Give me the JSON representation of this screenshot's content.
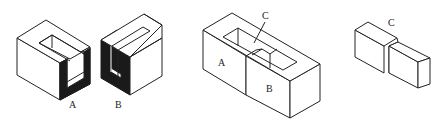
{
  "figures": [
    {
      "id": "block-a",
      "label": "A",
      "description": "Hollow block with U-shaped slot, dark inner walls visible on right"
    },
    {
      "id": "block-b",
      "label": "B",
      "description": "Hollow block with U-shaped slot, dark inner walls visible on left"
    },
    {
      "id": "assembled",
      "labels": {
        "left": "A",
        "right": "B",
        "pointer": "C"
      },
      "description": "Blocks A and B assembled with a slot on top, pointer to inner piece C"
    },
    {
      "id": "piece-c",
      "label": "C",
      "description": "Stepped key piece C"
    }
  ],
  "colors": {
    "line": "#222222",
    "shade": "#1a1a1a",
    "background": "#ffffff"
  }
}
